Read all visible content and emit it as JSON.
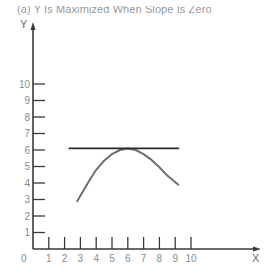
{
  "chart_data": {
    "type": "line",
    "title": "(a) Y Is Maximized When Slope Is Zero",
    "xlabel": "X",
    "ylabel": "Y",
    "xlim": [
      0,
      10
    ],
    "ylim": [
      0,
      10
    ],
    "x_ticks": [
      1,
      2,
      3,
      4,
      5,
      6,
      7,
      8,
      9,
      10
    ],
    "y_ticks": [
      1,
      2,
      3,
      4,
      5,
      6,
      7,
      8,
      9,
      10
    ],
    "x_origin_label": "0",
    "grid": false,
    "legend": null,
    "series": [
      {
        "name": "Y curve (inverted parabola)",
        "color": "#6e6e6e",
        "x": [
          2.8,
          3.5,
          4.0,
          4.5,
          5.0,
          5.5,
          6.0,
          6.5,
          7.0,
          7.5,
          8.0,
          8.5,
          9.2
        ],
        "y": [
          2.9,
          4.05,
          4.8,
          5.35,
          5.75,
          6.0,
          6.1,
          6.0,
          5.75,
          5.4,
          4.95,
          4.45,
          3.9
        ]
      },
      {
        "name": "Tangent line (slope = 0)",
        "color": "#2b2b2b",
        "x": [
          2.3,
          9.2
        ],
        "y": [
          6.1,
          6.1
        ]
      }
    ],
    "annotations": [
      {
        "text": "Maximum at X ≈ 6, Y ≈ 6 where slope is zero"
      }
    ]
  },
  "layout": {
    "origin_px": [
      33,
      249
    ],
    "x_unit_px": 15.8,
    "y_unit_px": 16.5,
    "x_axis_end_px": 261,
    "y_axis_top_px": 22,
    "axis_color": "#3a3a3a"
  }
}
